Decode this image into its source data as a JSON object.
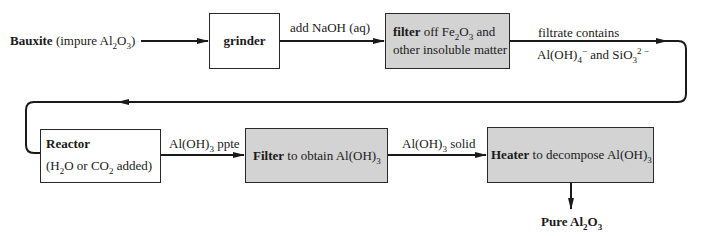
{
  "diagram": {
    "colors": {
      "line": "#1a1a1a",
      "box_border": "#2a2a2a",
      "process_fill": "#d3d3d3",
      "plain_fill": "#ffffff"
    },
    "input": {
      "bold": "Bauxite",
      "rest_pre": " (impure Al",
      "sub1": "2",
      "mid": "O",
      "sub2": "3",
      "post": ")"
    },
    "nodes": {
      "grinder": {
        "label": "grinder"
      },
      "filter1": {
        "bold": "filter",
        "line1_pre": " off Fe",
        "sub1": "2",
        "line1_mid": "O",
        "sub2": "3",
        "line1_post": " and",
        "line2": "other insoluble matter"
      },
      "reactor": {
        "title": "Reactor",
        "line2_pre": "(H",
        "sub1": "2",
        "line2_mid": "O or CO",
        "sub2": "2",
        "line2_post": " added)"
      },
      "filter2": {
        "bold": "Filter",
        "rest": " to obtain Al(OH)",
        "sub": "3"
      },
      "heater": {
        "bold": "Heater",
        "rest": " to decompose Al(OH)",
        "sub": "3"
      }
    },
    "edges": {
      "grinder_to_filter": {
        "label": "add NaOH (aq)"
      },
      "filter_to_reactor": {
        "line1": "filtrate contains",
        "line2_pre": "Al(OH)",
        "sub1": "4",
        "sup1": "−",
        "line2_mid": " and SiO",
        "sub2": "3",
        "sup2": "2 −"
      },
      "reactor_to_filter": {
        "pre": "Al(OH)",
        "sub": "3",
        "post": " ppte"
      },
      "filter_to_heater": {
        "pre": "Al(OH)",
        "sub": "3",
        "post": " solid"
      }
    },
    "output": {
      "bold_pre": "Pure Al",
      "sub1": "2",
      "mid": "O",
      "sub2": "3"
    }
  }
}
